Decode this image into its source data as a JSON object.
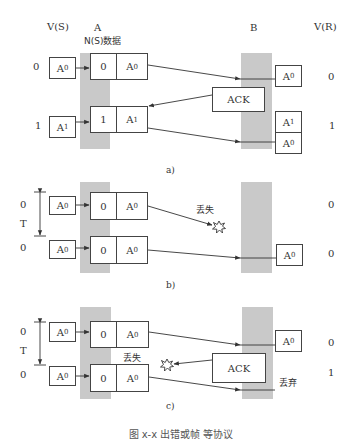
{
  "headers": {
    "vs": "V(S)",
    "a": "A",
    "ns_data": "N(S)数据",
    "b": "B",
    "vr": "V(R)"
  },
  "panels": {
    "a": {
      "label": "a)",
      "rows": [
        {
          "vs": "0",
          "frame_ns": "0",
          "frame_data": "A",
          "frame_sub": "0",
          "src": "A",
          "src_sub": "0"
        },
        {
          "vs": "1",
          "frame_ns": "1",
          "frame_data": "A",
          "frame_sub": "1",
          "src": "A",
          "src_sub": "1"
        }
      ],
      "receiver": [
        {
          "text": "A",
          "sub": "0"
        },
        {
          "text": "A",
          "sub": "1"
        },
        {
          "text": "A",
          "sub": "0"
        }
      ],
      "vr": [
        "0",
        "1"
      ],
      "ack": "ACK"
    },
    "b": {
      "label": "b)",
      "timer": "T",
      "lost": "丢失",
      "rows": [
        {
          "vs": "0",
          "frame_ns": "0",
          "frame_data": "A",
          "frame_sub": "0",
          "src": "A",
          "src_sub": "0"
        },
        {
          "vs": "0",
          "frame_ns": "0",
          "frame_data": "A",
          "frame_sub": "0",
          "src": "A",
          "src_sub": "0"
        }
      ],
      "receiver": [
        {
          "text": "A",
          "sub": "0"
        }
      ],
      "vr": [
        "0",
        "0"
      ]
    },
    "c": {
      "label": "c)",
      "timer": "T",
      "lost": "丢失",
      "discard": "丢弃",
      "ack": "ACK",
      "rows": [
        {
          "vs": "0",
          "frame_ns": "0",
          "frame_data": "A",
          "frame_sub": "0",
          "src": "A",
          "src_sub": "0"
        },
        {
          "vs": "0",
          "frame_ns": "0",
          "frame_data": "A",
          "frame_sub": "0",
          "src": "A",
          "src_sub": "0"
        }
      ],
      "receiver": [
        {
          "text": "A",
          "sub": "0"
        }
      ],
      "vr": [
        "0",
        "1"
      ]
    }
  },
  "caption": "图 x-x 出错或帧 等协议"
}
